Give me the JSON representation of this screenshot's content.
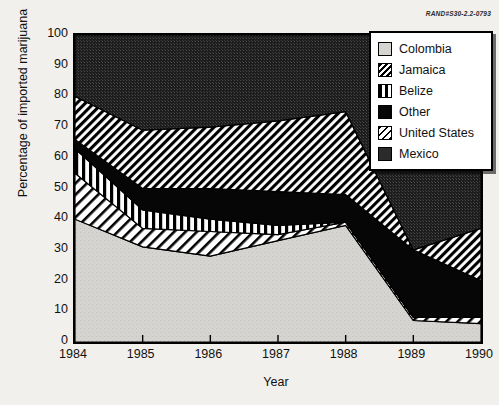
{
  "figure": {
    "rand_id": "RAND#S30-2.2-0793"
  },
  "legend": {
    "position": "top-right",
    "items": [
      {
        "label": "Colombia",
        "pattern": "solid-light-gray",
        "color": "#d4d2cf"
      },
      {
        "label": "Jamaica",
        "pattern": "diagonal-hatch-dense",
        "color": "#000000"
      },
      {
        "label": "Belize",
        "pattern": "vertical-bars",
        "color": "#000000"
      },
      {
        "label": "Other",
        "pattern": "solid-black",
        "color": "#050505"
      },
      {
        "label": "United States",
        "pattern": "diagonal-hatch-sparse",
        "color": "#000000"
      },
      {
        "label": "Mexico",
        "pattern": "solid-dark-gray",
        "color": "#2b2b2b"
      }
    ]
  },
  "axes": {
    "y_ticks": [
      100,
      90,
      80,
      70,
      60,
      50,
      40,
      30,
      20,
      10,
      0
    ],
    "x_ticks": [
      1984,
      1985,
      1986,
      1987,
      1988,
      1989,
      1990
    ]
  },
  "chart_data": {
    "type": "area",
    "title": "",
    "xlabel": "Year",
    "ylabel": "Percentage of imported marijuana",
    "xlim": [
      1984,
      1990
    ],
    "ylim": [
      0,
      100
    ],
    "grid": false,
    "stacked": true,
    "legend_position": "top-right",
    "categories": [
      "1984",
      "1985",
      "1986",
      "1987",
      "1988",
      "1989",
      "1990"
    ],
    "x": [
      1984,
      1985,
      1986,
      1987,
      1988,
      1989,
      1990
    ],
    "series": [
      {
        "name": "Colombia",
        "values": [
          40,
          31,
          28,
          33,
          38,
          7,
          6
        ]
      },
      {
        "name": "United States",
        "values": [
          15,
          6,
          8,
          2,
          1,
          1,
          2
        ]
      },
      {
        "name": "Belize",
        "values": [
          8,
          6,
          4,
          3,
          0,
          0,
          0
        ]
      },
      {
        "name": "Other",
        "values": [
          3,
          7,
          10,
          11,
          9,
          22,
          12
        ]
      },
      {
        "name": "Jamaica",
        "values": [
          14,
          19,
          20,
          23,
          27,
          0,
          17
        ]
      },
      {
        "name": "Mexico",
        "values": [
          20,
          31,
          30,
          28,
          25,
          70,
          63
        ]
      }
    ],
    "cumulative_tops": {
      "Colombia": [
        40,
        31,
        28,
        33,
        38,
        7,
        6
      ],
      "United States": [
        55,
        37,
        36,
        35,
        39,
        8,
        8
      ],
      "Belize": [
        63,
        43,
        40,
        38,
        39,
        8,
        8
      ],
      "Other": [
        66,
        50,
        50,
        49,
        48,
        30,
        20
      ],
      "Jamaica": [
        80,
        69,
        70,
        72,
        75,
        30,
        37
      ],
      "Mexico": [
        100,
        100,
        100,
        100,
        100,
        100,
        100
      ]
    }
  }
}
